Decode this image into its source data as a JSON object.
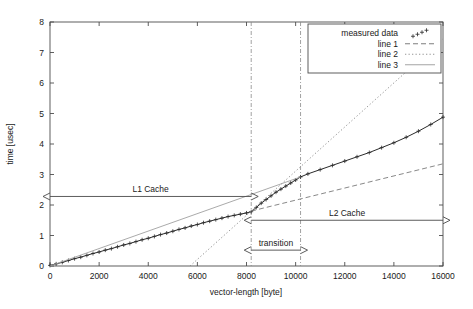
{
  "chart_data": {
    "type": "line",
    "title": "",
    "xlabel": "vector-length [byte]",
    "ylabel": "time [usec]",
    "xlim": [
      0,
      16000
    ],
    "ylim": [
      0,
      8
    ],
    "xticks": [
      0,
      2000,
      4000,
      6000,
      8000,
      10000,
      12000,
      14000,
      16000
    ],
    "xtick_labels": [
      "0",
      "2000",
      "4000",
      "6000",
      "8000",
      "10000",
      "12000",
      "14000",
      "16000"
    ],
    "yticks": [
      0,
      1,
      2,
      3,
      4,
      5,
      6,
      7,
      8
    ],
    "ytick_labels": [
      "0",
      "1",
      "2",
      "3",
      "4",
      "5",
      "6",
      "7",
      "8"
    ],
    "grid": false,
    "legend_position": "top-right",
    "legend": [
      {
        "label": "measured data",
        "style": "points",
        "color": "#2b2b2b"
      },
      {
        "label": "line 1",
        "style": "dashed",
        "color": "#6e6e6e"
      },
      {
        "label": "line 2",
        "style": "dotted",
        "color": "#8a8a8a"
      },
      {
        "label": "line 3",
        "style": "solid",
        "color": "#9a9a9a"
      }
    ],
    "series": [
      {
        "name": "measured data",
        "style": "points",
        "color": "#2b2b2b",
        "x": [
          0,
          250,
          500,
          750,
          1000,
          1250,
          1500,
          1750,
          2000,
          2250,
          2500,
          2750,
          3000,
          3250,
          3500,
          3750,
          4000,
          4250,
          4500,
          4750,
          5000,
          5250,
          5500,
          5750,
          6000,
          6250,
          6500,
          6750,
          7000,
          7250,
          7500,
          7750,
          8000,
          8192,
          8400,
          8600,
          8800,
          9000,
          9200,
          9400,
          9600,
          9800,
          10000,
          10200,
          10500,
          11000,
          11500,
          12000,
          12500,
          13000,
          13500,
          14000,
          14500,
          15000,
          15500,
          16000
        ],
        "y": [
          0.02,
          0.07,
          0.12,
          0.18,
          0.24,
          0.29,
          0.35,
          0.41,
          0.46,
          0.52,
          0.57,
          0.63,
          0.69,
          0.74,
          0.8,
          0.86,
          0.91,
          0.97,
          1.03,
          1.08,
          1.14,
          1.2,
          1.25,
          1.31,
          1.36,
          1.42,
          1.47,
          1.52,
          1.57,
          1.62,
          1.66,
          1.7,
          1.74,
          1.78,
          1.92,
          2.06,
          2.18,
          2.3,
          2.42,
          2.52,
          2.62,
          2.72,
          2.82,
          2.92,
          3.02,
          3.16,
          3.3,
          3.44,
          3.58,
          3.72,
          3.88,
          4.04,
          4.22,
          4.42,
          4.64,
          4.88
        ]
      },
      {
        "name": "line 1",
        "style": "dashed",
        "color": "#7a7a7a",
        "x": [
          8192,
          16000
        ],
        "y": [
          1.8,
          3.35
        ]
      },
      {
        "name": "line 2",
        "style": "dotted",
        "color": "#8a8a8a",
        "x": [
          5700,
          16000
        ],
        "y": [
          0.0,
          7.45
        ]
      },
      {
        "name": "line 3",
        "style": "solid",
        "color": "#a0a0a0",
        "x": [
          0,
          10200
        ],
        "y": [
          0.0,
          2.92
        ]
      }
    ],
    "vertical_markers": [
      {
        "x": 8192,
        "style": "dash-dot",
        "color": "#8a8a8a"
      },
      {
        "x": 10200,
        "style": "dash-dot",
        "color": "#8a8a8a"
      }
    ],
    "annotations": [
      {
        "name": "l1-cache",
        "label": "L1 Cache",
        "x_start": 0,
        "x_end": 8192,
        "y": 2.28,
        "arrow": "both"
      },
      {
        "name": "l2-cache",
        "label": "L2 Cache",
        "x_start": 8192,
        "x_end": 16000,
        "y": 1.5,
        "arrow": "both"
      },
      {
        "name": "transition",
        "label": "transition",
        "x_start": 8192,
        "x_end": 10200,
        "y": 0.52,
        "arrow": "both"
      }
    ]
  }
}
